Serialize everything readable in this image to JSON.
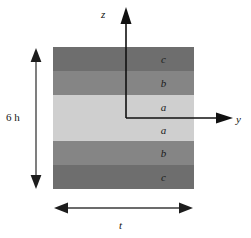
{
  "figure": {
    "background_color": "#ffffff"
  },
  "laminate": {
    "description": "Symmetric six-layer laminate cross-section",
    "x": 53,
    "y": 47,
    "width": 141,
    "height": 142,
    "layers": [
      {
        "label": "c",
        "color": "#6e6e6e",
        "top": 0,
        "height": 24
      },
      {
        "label": "b",
        "color": "#858585",
        "top": 24,
        "height": 24
      },
      {
        "label": "a",
        "color": "#cfcfcf",
        "top": 48,
        "height": 23
      },
      {
        "label": "a",
        "color": "#cfcfcf",
        "top": 71,
        "height": 23
      },
      {
        "label": "b",
        "color": "#858585",
        "top": 94,
        "height": 24
      },
      {
        "label": "c",
        "color": "#6e6e6e",
        "top": 118,
        "height": 24
      }
    ]
  },
  "axes": {
    "origin": {
      "x": 126,
      "y": 118
    },
    "color": "#111111",
    "vertical": {
      "name": "z",
      "label": "z",
      "direction": "up",
      "tip_y": 8,
      "label_x": 101,
      "label_y": 8
    },
    "horizontal": {
      "name": "y",
      "label": "y",
      "direction": "right",
      "tip_x": 232,
      "label_x": 236,
      "label_y": 113
    }
  },
  "dimensions": [
    {
      "name": "thickness",
      "label": "6 h",
      "orientation": "vertical",
      "arrow_x": 36,
      "arrow_top": 49,
      "arrow_bottom": 188,
      "label_x": 6,
      "label_y": 111,
      "color": "#2a2a2a"
    },
    {
      "name": "width",
      "label": "t",
      "orientation": "horizontal",
      "arrow_y": 208,
      "arrow_left": 55,
      "arrow_right": 192,
      "label_x": 119,
      "label_y": 219,
      "color": "#2a2a2a"
    }
  ]
}
